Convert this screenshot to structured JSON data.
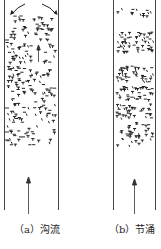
{
  "figure": {
    "panels": [
      {
        "id": "a",
        "label": "（a）沟流",
        "description": "churn flow in vertical tube with upward arrow and recirculating arrows at top"
      },
      {
        "id": "b",
        "label": "（b）节涌",
        "description": "slug flow in vertical tube with upward arrow and bands of particles"
      }
    ],
    "colors": {
      "stroke": "#333333",
      "background": "#ffffff"
    }
  }
}
